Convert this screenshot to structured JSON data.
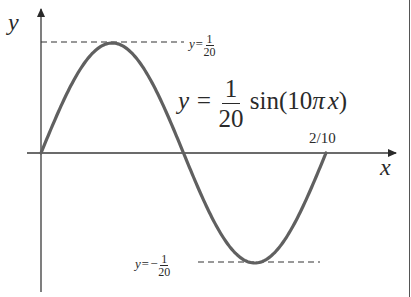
{
  "chart_data": {
    "type": "line",
    "title": "",
    "function": "y = (1/20) sin(10πx)",
    "xlabel": "x",
    "ylabel": "y",
    "x_domain": [
      0,
      0.2
    ],
    "x_tick_labels": [
      "2/10"
    ],
    "amplitude": 0.05,
    "period": 0.2,
    "reference_lines": [
      {
        "y": 0.05,
        "label": "y=1/20",
        "style": "dashed"
      },
      {
        "y": -0.05,
        "label": "y=−1/20",
        "style": "dashed"
      }
    ],
    "x": [
      0,
      0.025,
      0.05,
      0.075,
      0.1,
      0.125,
      0.15,
      0.175,
      0.2
    ],
    "y": [
      0,
      0.0354,
      0.05,
      0.0354,
      0,
      -0.0354,
      -0.05,
      -0.0354,
      0
    ],
    "annotations": [
      "y = 1/20 sin(10πx)",
      "2/10"
    ],
    "grid": false,
    "legend": "none"
  },
  "labels": {
    "y_axis": "y",
    "x_axis": "x",
    "top_ref_prefix": "y=",
    "top_ref_num": "1",
    "top_ref_den": "20",
    "bottom_ref_prefix": "y=−",
    "bottom_ref_num": "1",
    "bottom_ref_den": "20",
    "eq_lhs": "y =",
    "eq_num": "1",
    "eq_den": "20",
    "eq_rhs_func": "sin(10",
    "eq_rhs_pi": "π",
    "eq_rhs_x": "x",
    "eq_rhs_close": ")",
    "x_tick": "2/10"
  },
  "colors": {
    "curve": "#606060",
    "axes": "#3a3a3a",
    "text": "#2a2a2a"
  }
}
